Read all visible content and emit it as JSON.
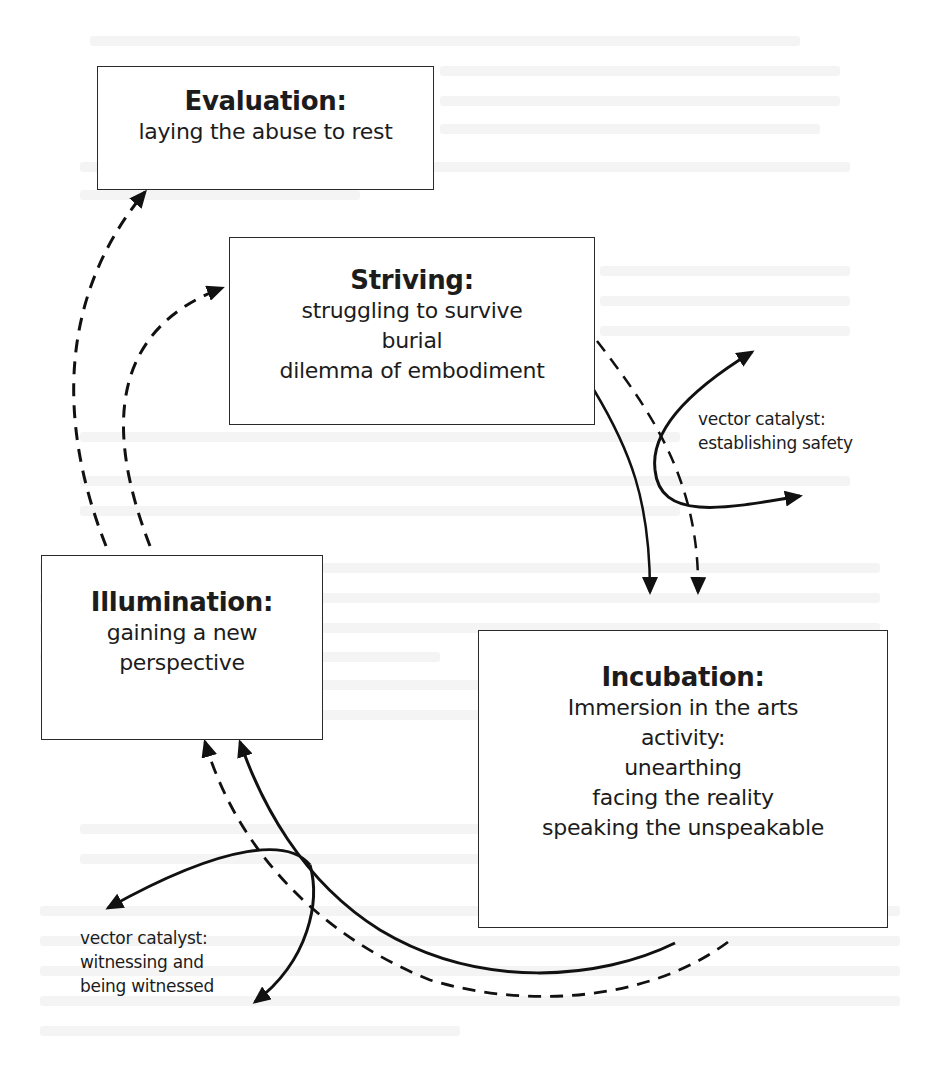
{
  "diagram": {
    "type": "process-cycle",
    "nodes": [
      {
        "id": "evaluation",
        "title": "Evaluation:",
        "lines": [
          "laying the abuse to rest"
        ]
      },
      {
        "id": "striving",
        "title": "Striving:",
        "lines": [
          "struggling to survive",
          "burial",
          "dilemma of embodiment"
        ]
      },
      {
        "id": "illumination",
        "title": "Illumination:",
        "lines": [
          "gaining a new",
          "perspective"
        ]
      },
      {
        "id": "incubation",
        "title": "Incubation:",
        "lines": [
          "Immersion in the arts",
          "activity:",
          "unearthing",
          "facing the reality",
          "speaking the unspeakable"
        ]
      }
    ],
    "catalysts": [
      {
        "id": "safety",
        "lines": [
          "vector catalyst:",
          "establishing safety"
        ]
      },
      {
        "id": "witnessing",
        "lines": [
          "vector catalyst:",
          "witnessing and",
          "being witnessed"
        ]
      }
    ],
    "edges": [
      {
        "from": "illumination",
        "to": "evaluation",
        "style": "dashed"
      },
      {
        "from": "illumination",
        "to": "striving",
        "style": "dashed"
      },
      {
        "from": "striving",
        "to": "incubation",
        "style": "solid"
      },
      {
        "from": "striving",
        "to": "incubation",
        "style": "dashed"
      },
      {
        "from": "incubation",
        "to": "illumination",
        "style": "solid"
      },
      {
        "from": "incubation",
        "to": "illumination",
        "style": "dashed"
      },
      {
        "from": "striving-incubation",
        "to": "safety",
        "style": "solid",
        "note": "catalyst loop with two arrowheads"
      },
      {
        "from": "incubation-illumination",
        "to": "witnessing",
        "style": "solid",
        "note": "catalyst loop with two arrowheads"
      }
    ]
  }
}
